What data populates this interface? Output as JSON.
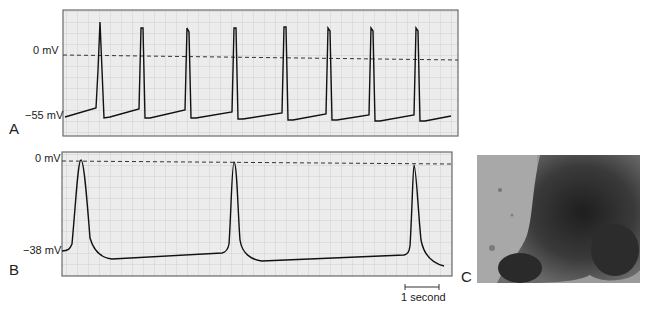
{
  "panels": {
    "a": {
      "letter": "A",
      "top_label": "0 mV",
      "bottom_label": "−55 mV",
      "spike_x": [
        99,
        141,
        187,
        235,
        285,
        328,
        371,
        416
      ]
    },
    "b": {
      "letter": "B",
      "top_label": "0 mV",
      "bottom_label": "−38 mV",
      "spike_x": [
        81,
        234,
        414
      ]
    },
    "c": {
      "letter": "C"
    }
  },
  "scale_bar": {
    "label": "1 second"
  },
  "caption": "FIGURE"
}
